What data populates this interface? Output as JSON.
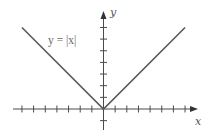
{
  "chart_data": {
    "type": "line",
    "title": "",
    "xlabel": "x",
    "ylabel": "y",
    "xlim": [
      -7,
      7
    ],
    "ylim": [
      -1,
      7
    ],
    "x_ticks": [
      -7,
      -6,
      -5,
      -4,
      -3,
      -2,
      -1,
      1,
      2,
      3,
      4,
      5,
      6,
      7
    ],
    "y_ticks": [
      -1,
      1,
      2,
      3,
      4,
      5,
      6,
      7
    ],
    "tick_labels_shown": false,
    "grid": false,
    "series": [
      {
        "name": "y = |x|",
        "x": [
          -7,
          0,
          7
        ],
        "y": [
          7,
          0,
          7
        ]
      }
    ],
    "annotations": [
      {
        "text": "y = |x|",
        "near": "upper-left branch"
      }
    ],
    "colors": {
      "curve": "#5a5a5a",
      "axes": "#4a4a4a"
    }
  }
}
